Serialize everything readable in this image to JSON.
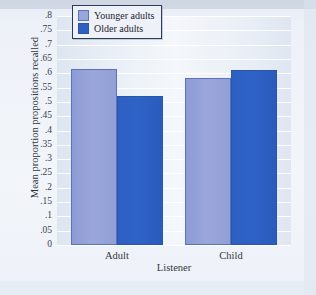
{
  "chart_data": {
    "type": "bar",
    "title": "",
    "xlabel": "Listener",
    "ylabel": "Mean proportion propositions recalled",
    "categories": [
      "Adult",
      "Child"
    ],
    "series": [
      {
        "name": "Younger adults",
        "color": "#9aa6db",
        "values": [
          0.615,
          0.585
        ]
      },
      {
        "name": "Older adults",
        "color": "#2e60c2",
        "values": [
          0.52,
          0.61
        ]
      }
    ],
    "ylim": [
      0,
      0.8
    ],
    "ytick_values": [
      0,
      0.05,
      0.1,
      0.15,
      0.2,
      0.25,
      0.3,
      0.35,
      0.4,
      0.45,
      0.5,
      0.55,
      0.6,
      0.65,
      0.7,
      0.75,
      0.8
    ],
    "ytick_labels": [
      "0",
      ".05",
      ".1",
      ".15",
      ".2",
      ".25",
      ".3",
      ".35",
      ".4",
      ".45",
      ".5",
      ".55",
      ".6",
      ".65",
      ".7",
      ".75",
      ".8"
    ],
    "grid": true,
    "legend_position": "top-center",
    "background_color": "#eef2f8",
    "gridline_color": "#ffffff"
  },
  "legend": {
    "items": [
      {
        "label": "Younger adults"
      },
      {
        "label": "Older adults"
      }
    ]
  }
}
